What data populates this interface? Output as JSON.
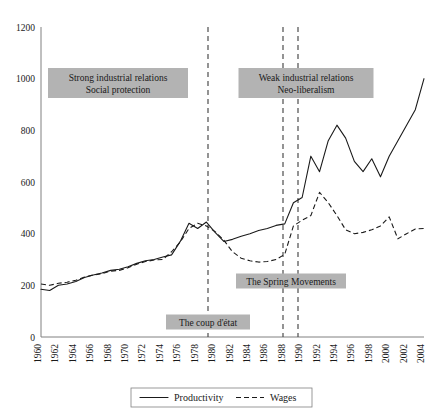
{
  "chart_data": {
    "type": "line",
    "title": "",
    "xlabel": "",
    "ylabel": "",
    "ylim": [
      0,
      1200
    ],
    "y_ticks": [
      0,
      200,
      400,
      600,
      800,
      1000,
      1200
    ],
    "grid": false,
    "legend_position": "bottom",
    "x": [
      1960,
      1961,
      1962,
      1963,
      1964,
      1965,
      1966,
      1967,
      1968,
      1969,
      1970,
      1971,
      1972,
      1973,
      1974,
      1975,
      1976,
      1977,
      1978,
      1979,
      1980,
      1981,
      1982,
      1983,
      1984,
      1985,
      1986,
      1987,
      1988,
      1989,
      1990,
      1991,
      1992,
      1993,
      1994,
      1995,
      1996,
      1997,
      1998,
      1999,
      2000,
      2001,
      2002,
      2003,
      2004
    ],
    "x_tick_labels": [
      "1960",
      "1962",
      "1964",
      "1966",
      "1968",
      "1970",
      "1972",
      "1974",
      "1976",
      "1978",
      "1980",
      "1982",
      "1984",
      "1986",
      "1988",
      "1990",
      "1992",
      "1994",
      "1996",
      "1998",
      "2000",
      "2002",
      "2004"
    ],
    "series": [
      {
        "name": "Productivity",
        "style": "solid",
        "values": [
          185,
          180,
          200,
          205,
          215,
          230,
          240,
          248,
          258,
          262,
          272,
          285,
          295,
          300,
          310,
          318,
          370,
          440,
          420,
          445,
          405,
          370,
          378,
          390,
          400,
          412,
          420,
          432,
          438,
          520,
          540,
          700,
          640,
          760,
          820,
          770,
          680,
          640,
          690,
          620,
          700,
          760,
          820,
          880,
          1000
        ]
      },
      {
        "name": "Wages",
        "style": "dashed",
        "values": [
          205,
          200,
          208,
          212,
          220,
          232,
          240,
          245,
          255,
          258,
          268,
          282,
          292,
          298,
          300,
          330,
          368,
          420,
          440,
          430,
          408,
          375,
          330,
          305,
          295,
          290,
          292,
          300,
          320,
          430,
          452,
          470,
          560,
          520,
          470,
          415,
          400,
          405,
          415,
          430,
          465,
          380,
          400,
          418,
          420
        ]
      }
    ],
    "annotations": [
      {
        "id": "strong-industrial-relations",
        "lines": [
          "Strong industrial relations",
          "Social protection"
        ],
        "x_center": 118,
        "y_center": 83,
        "width": 140,
        "height": 30
      },
      {
        "id": "weak-industrial-relations",
        "lines": [
          "Weak industrial relations",
          "Neo-liberalism"
        ],
        "x_center": 306,
        "y_center": 83,
        "width": 135,
        "height": 30
      },
      {
        "id": "coup-detat",
        "lines": [
          "The coup d'état"
        ],
        "x_center": 208,
        "y_center": 322,
        "width": 84,
        "height": 15
      },
      {
        "id": "spring-movements",
        "lines": [
          "The Spring Movements"
        ],
        "x_center": 291,
        "y_center": 281,
        "width": 110,
        "height": 15
      }
    ],
    "event_lines": [
      {
        "id": "coup-line",
        "x_px": 208
      },
      {
        "id": "spring-line-1",
        "x_px": 283
      },
      {
        "id": "spring-line-2",
        "x_px": 298
      }
    ]
  },
  "legend": {
    "productivity_label": "Productivity",
    "wages_label": "Wages"
  }
}
